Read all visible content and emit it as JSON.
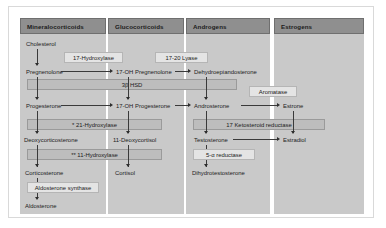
{
  "diagram": {
    "colors": {
      "page_background": "#ffffff",
      "frame_border": "#d9d9d9",
      "column_fill": "#c9c9c9",
      "column_header_fill": "#8f8f8f",
      "enzyme_box_fill": "#bdbdbd",
      "enzyme_box_light_fill": "#e4e4e4",
      "arrow": "#2d2d2d",
      "text": "#1c1c1c"
    },
    "columns": [
      {
        "id": "mineralocorticoids",
        "label": "Mineralocorticoids"
      },
      {
        "id": "glucocorticoids",
        "label": "Glucocorticoids"
      },
      {
        "id": "androgens",
        "label": "Androgens"
      },
      {
        "id": "estrogens",
        "label": "Estrogens"
      }
    ],
    "metabolites": {
      "cholesterol": "Cholesterol",
      "pregnenolone": "Pregnenolone",
      "progesterone": "Progesterone",
      "deoxycorticosterone": "Deoxycorticosterone",
      "corticosterone": "Corticosterone",
      "aldosterone": "Aldosterone",
      "oh_pregnenolone": "17-OH Pregnenolone",
      "oh_progesterone": "17-OH Progesterone",
      "deoxycortisol": "11-Deoxycortisol",
      "cortisol": "Cortisol",
      "dhea": "Dehydroepiandosterone",
      "androsterone": "Androsterone",
      "testosterone": "Testosterone",
      "dihydrotestosterone": "Dihydrotestosterone",
      "estrone": "Estrone",
      "estradiol": "Estradiol"
    },
    "enzymes": {
      "hydroxylase_17": "17-Hydroxylase",
      "lyase_17_20": "17-20 Lyase",
      "hsd_3b": "3β HSD",
      "aromatase": "Aromatase",
      "hydroxylase_21": "* 21-Hydroxylase",
      "ketosteroid_reductase_17": "17 Ketosteroid reductase",
      "hydroxylase_11": "** 11-Hydroxylase",
      "reductase_5a": "5-α reductase",
      "aldosterone_synthase": "Aldosterone synthase"
    }
  }
}
